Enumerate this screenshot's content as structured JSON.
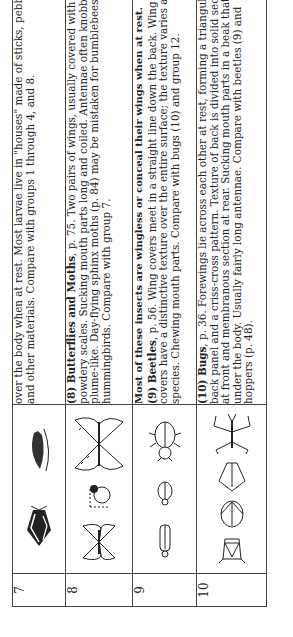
{
  "table": {
    "rows": [
      {
        "number": "7",
        "icons": [
          "caddisfly-icon",
          "caddisfly-larva-icon"
        ],
        "text": [
          {
            "bold": "",
            "body": "over the body when at rest. Most larvae live in \"houses\" made of sticks, pebbles, and other materials. Compare with groups 1 through 4, and 8."
          }
        ]
      },
      {
        "number": "8",
        "icons": [
          "moth-icon",
          "caterpillar-icon",
          "butterfly-icon"
        ],
        "text": [
          {
            "bold": "(8) Butterflies and Moths",
            "body": ", p. 75. Two pairs of wings, usually covered with fine, powdery scales. Sucking mouth parts long and coiled. Antennae often knobbed or plume-like. Day-flying sphinx moths (p. 84) may be mistaken for bumblebees or hummingbirds. Compare with group 7."
          }
        ]
      },
      {
        "number": "9",
        "heading": "Most of these insects are wingless or conceal their wings when at rest.",
        "icons": [
          "long-beetle-icon",
          "small-beetle-icon",
          "ground-beetle-icon"
        ],
        "text": [
          {
            "bold": "(9) Beetles",
            "body": ", p. 56. Wing covers meet in a straight line down the back. Wing covers have a distinctive texture over the entire surface; the texture varies among species. Chewing mouth parts. Compare with bugs (10) and group 12."
          }
        ]
      },
      {
        "number": "10",
        "icons": [
          "stink-bug-icon",
          "leaf-bug-icon",
          "water-bug-icon",
          "water-strider-icon"
        ],
        "text": [
          {
            "bold": "(10) Bugs",
            "body": ", p. 36. Forewings lie across each other at rest, forming a triangular back panel and a criss-cross pattern. Texture of back is divided into solid section at front and membranous section at rear. Sucking mouth parts in a beak that folds under the body. Usually fairly long antennae. Compare with beetles (9) and hoppers (p. 48)."
          }
        ]
      }
    ]
  }
}
